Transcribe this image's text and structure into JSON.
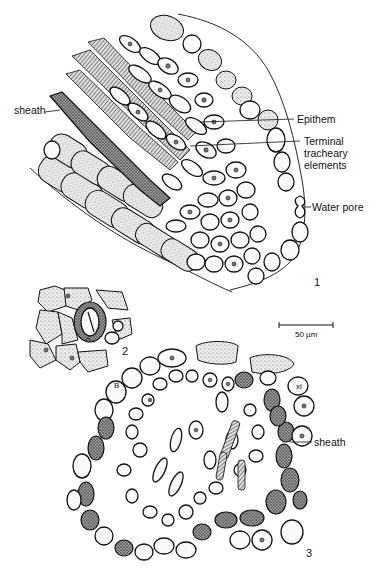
{
  "figure": {
    "panel_1": {
      "number": "1",
      "labels": {
        "sheath": "sheath",
        "epithem": "Epithem",
        "terminal_tracheary_line1": "Terminal",
        "terminal_tracheary_line2": "tracheary",
        "terminal_tracheary_line3": "elements",
        "water_pore": "Water pore"
      },
      "scale_bar": "50 µm"
    },
    "panel_2": {
      "number": "2"
    },
    "panel_3": {
      "number": "3",
      "labels": {
        "sheath": "sheath",
        "b_marker": "B",
        "xl_marker": "xl"
      }
    }
  }
}
